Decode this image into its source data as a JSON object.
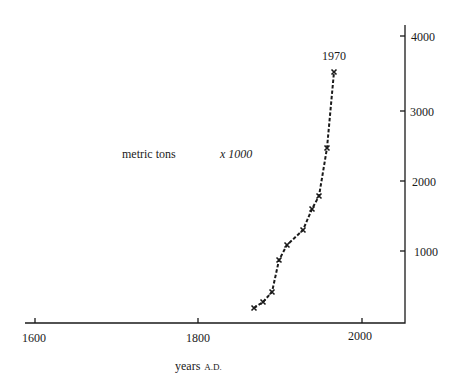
{
  "chart_data": {
    "type": "line",
    "title": "",
    "xlabel": "years",
    "xlabel_suffix": "A.D.",
    "ylabel": "metric tons",
    "ylabel_multiplier": "x 1000",
    "x_ticks": [
      1600,
      1800,
      2000
    ],
    "y_ticks": [
      1000,
      2000,
      3000,
      4000
    ],
    "xlim": [
      1590,
      2065
    ],
    "ylim": [
      0,
      4150
    ],
    "y_axis_position": "right",
    "grid": false,
    "series": [
      {
        "name": "production",
        "marker": "x",
        "line_style": "dashed",
        "x": [
          1870,
          1880,
          1890,
          1900,
          1910,
          1930,
          1940,
          1950,
          1960,
          1970
        ],
        "values": [
          210,
          290,
          430,
          880,
          1090,
          1300,
          1600,
          1770,
          2440,
          3500
        ]
      }
    ],
    "annotations": [
      {
        "text": "1970",
        "x": 1970,
        "y": 3500,
        "position": "above"
      }
    ]
  },
  "labels": {
    "ylabel": "metric tons",
    "multiplier": "x 1000",
    "xlabel_main": "years",
    "xlabel_suffix": "A.D.",
    "annotation": "1970",
    "xticks": [
      "1600",
      "1800",
      "2000"
    ],
    "yticks": [
      "1000",
      "2000",
      "3000",
      "4000"
    ]
  }
}
